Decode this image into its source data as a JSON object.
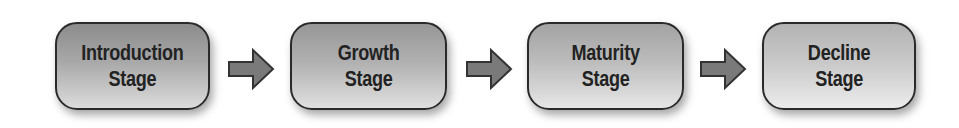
{
  "diagram": {
    "type": "flow",
    "direction": "left-to-right",
    "stages": [
      {
        "line1": "Introduction",
        "line2": "Stage"
      },
      {
        "line1": "Growth",
        "line2": "Stage"
      },
      {
        "line1": "Maturity",
        "line2": "Stage"
      },
      {
        "line1": "Decline",
        "line2": "Stage"
      }
    ],
    "connectors": [
      {
        "from": 0,
        "to": 1,
        "icon": "right-arrow-icon"
      },
      {
        "from": 1,
        "to": 2,
        "icon": "right-arrow-icon"
      },
      {
        "from": 2,
        "to": 3,
        "icon": "right-arrow-icon"
      }
    ],
    "colors": {
      "box_border": "#2a2a2a",
      "text": "#222222",
      "arrow_fill": "#7a7a7a",
      "arrow_stroke": "#333333"
    }
  }
}
